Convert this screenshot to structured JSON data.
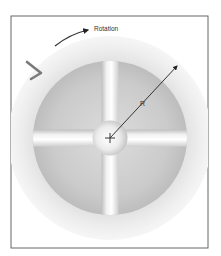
{
  "diagram": {
    "type": "rotor-cross-section",
    "labels": {
      "rotation": "Rotation",
      "radius": "R"
    },
    "frame": {
      "x": 11,
      "y": 16,
      "width": 197,
      "height": 232,
      "stroke": "#555555"
    },
    "center": {
      "x": 110,
      "y": 138
    },
    "outer_ring": {
      "radius": 102,
      "color": "#ececec"
    },
    "inner_disc": {
      "radius": 77,
      "color": "#c8c8c8"
    },
    "spokes": {
      "width": 17,
      "color": "#e6e6e6"
    },
    "hub": {
      "radius": 17,
      "color": "#f0f0f0"
    },
    "radius_arrow": {
      "x1": 110,
      "y1": 138,
      "x2": 177,
      "y2": 66,
      "color": "#222222"
    },
    "rotation_arrow": {
      "color": "#222222"
    },
    "flow_chevron": {
      "color": "#7a7a7a"
    }
  }
}
